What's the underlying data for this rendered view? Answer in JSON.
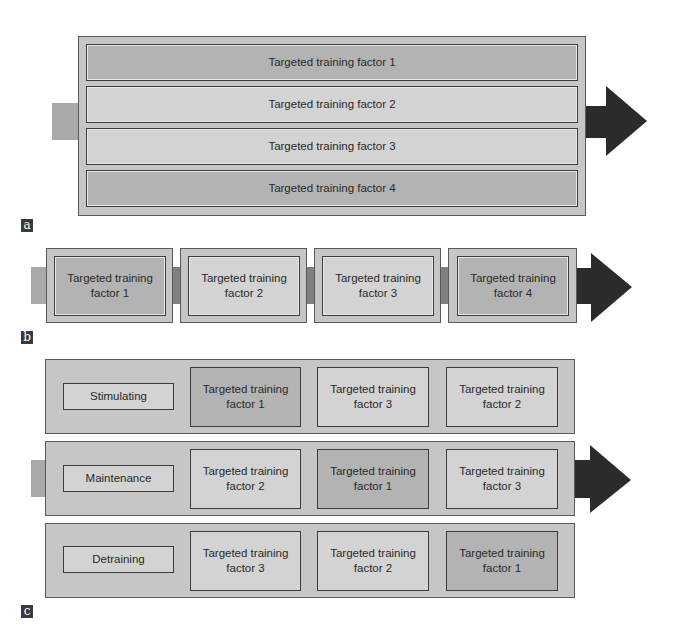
{
  "colors": {
    "container_fill": "#c6c6c6",
    "emphasized_fill": "#b3b3b3",
    "normal_fill": "#d3d3d3",
    "arrow_fill": "#2b2b2b",
    "stub_fill": "#a9a9a9",
    "connector_fill": "#808080",
    "label_bg": "#3a3a3a"
  },
  "panel_a": {
    "label": "a",
    "bars": [
      {
        "text": "Targeted training factor 1",
        "emphasized": true
      },
      {
        "text": "Targeted training factor 2",
        "emphasized": false
      },
      {
        "text": "Targeted training factor 3",
        "emphasized": false
      },
      {
        "text": "Targeted training factor 4",
        "emphasized": true
      }
    ]
  },
  "panel_b": {
    "label": "b",
    "blocks": [
      {
        "line1": "Targeted training",
        "line2": "factor 1",
        "emphasized": true
      },
      {
        "line1": "Targeted training",
        "line2": "factor 2",
        "emphasized": false
      },
      {
        "line1": "Targeted training",
        "line2": "factor 3",
        "emphasized": false
      },
      {
        "line1": "Targeted training",
        "line2": "factor 4",
        "emphasized": true
      }
    ]
  },
  "panel_c": {
    "label": "c",
    "rows": [
      {
        "phase": "Stimulating",
        "factors": [
          {
            "line1": "Targeted training",
            "line2": "factor 1",
            "emphasized": true
          },
          {
            "line1": "Targeted training",
            "line2": "factor 3",
            "emphasized": false
          },
          {
            "line1": "Targeted training",
            "line2": "factor 2",
            "emphasized": false
          }
        ]
      },
      {
        "phase": "Maintenance",
        "factors": [
          {
            "line1": "Targeted training",
            "line2": "factor 2",
            "emphasized": false
          },
          {
            "line1": "Targeted training",
            "line2": "factor 1",
            "emphasized": true
          },
          {
            "line1": "Targeted training",
            "line2": "factor 3",
            "emphasized": false
          }
        ]
      },
      {
        "phase": "Detraining",
        "factors": [
          {
            "line1": "Targeted training",
            "line2": "factor 3",
            "emphasized": false
          },
          {
            "line1": "Targeted training",
            "line2": "factor 2",
            "emphasized": false
          },
          {
            "line1": "Targeted training",
            "line2": "factor 1",
            "emphasized": true
          }
        ]
      }
    ]
  }
}
